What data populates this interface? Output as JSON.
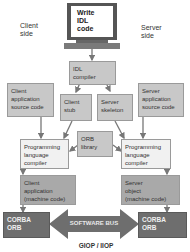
{
  "labels": {
    "client_side": "Client\nside",
    "server_side": "Server\nside",
    "bottom": "GIOP / IIOP"
  },
  "monitor": {
    "text": "Write\nIDL\ncode"
  },
  "boxes": {
    "idl_compiler": "IDL\ncompiler",
    "client_source": "Client\napplication\nsource code",
    "client_stub": "Client\nstub",
    "server_skeleton": "Server\nskeleton",
    "server_source": "Server\napplication\nsource code",
    "orb_library": "ORB\nlibrary",
    "client_compiler": "Programming\nlanguage\ncompiler",
    "server_compiler": "Programming\nlanguage\ncompiler",
    "client_app": "Client\napplication\n(machine code)",
    "server_obj": "Server\nobject\n(machine code)",
    "client_orb": "CORBA\nORB",
    "server_orb": "CORBA\nORB",
    "bus": "SOFTWARE BUS"
  }
}
